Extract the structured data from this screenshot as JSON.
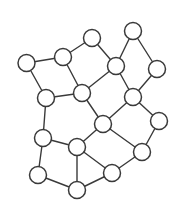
{
  "diagram": {
    "type": "undirected-graph",
    "node_radius": 8.5,
    "colors": {
      "background": "#ffffff",
      "stroke": "#3a3a3a",
      "node_fill": "#ffffff"
    },
    "nodes": [
      {
        "id": "A",
        "x": 26.5,
        "y": 63
      },
      {
        "id": "B",
        "x": 63,
        "y": 57
      },
      {
        "id": "C",
        "x": 92,
        "y": 38
      },
      {
        "id": "D",
        "x": 46,
        "y": 98
      },
      {
        "id": "E",
        "x": 82,
        "y": 93
      },
      {
        "id": "F",
        "x": 133,
        "y": 31
      },
      {
        "id": "G",
        "x": 116,
        "y": 66
      },
      {
        "id": "H",
        "x": 157,
        "y": 69
      },
      {
        "id": "I",
        "x": 133,
        "y": 97
      },
      {
        "id": "J",
        "x": 43,
        "y": 138
      },
      {
        "id": "K",
        "x": 77,
        "y": 147
      },
      {
        "id": "L",
        "x": 103,
        "y": 124
      },
      {
        "id": "M",
        "x": 38,
        "y": 175
      },
      {
        "id": "N",
        "x": 77,
        "y": 190
      },
      {
        "id": "O",
        "x": 159,
        "y": 121
      },
      {
        "id": "P",
        "x": 142,
        "y": 152
      },
      {
        "id": "Q",
        "x": 112,
        "y": 173
      }
    ],
    "edges": [
      [
        "A",
        "B"
      ],
      [
        "A",
        "D"
      ],
      [
        "B",
        "C"
      ],
      [
        "B",
        "E"
      ],
      [
        "C",
        "G"
      ],
      [
        "D",
        "E"
      ],
      [
        "D",
        "J"
      ],
      [
        "E",
        "G"
      ],
      [
        "E",
        "L"
      ],
      [
        "F",
        "G"
      ],
      [
        "F",
        "H"
      ],
      [
        "G",
        "I"
      ],
      [
        "H",
        "I"
      ],
      [
        "I",
        "L"
      ],
      [
        "I",
        "O"
      ],
      [
        "L",
        "K"
      ],
      [
        "L",
        "P"
      ],
      [
        "O",
        "P"
      ],
      [
        "J",
        "K"
      ],
      [
        "J",
        "M"
      ],
      [
        "K",
        "N"
      ],
      [
        "K",
        "Q"
      ],
      [
        "M",
        "N"
      ],
      [
        "N",
        "Q"
      ],
      [
        "P",
        "Q"
      ]
    ]
  }
}
